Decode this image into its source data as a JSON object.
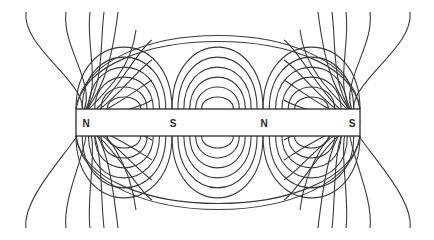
{
  "diagram": {
    "bar": {
      "x": 76,
      "y": 109,
      "width": 284,
      "height": 27
    },
    "poles": [
      {
        "label": "N",
        "x": 86,
        "y": 123
      },
      {
        "label": "S",
        "x": 173,
        "y": 123
      },
      {
        "label": "N",
        "x": 264,
        "y": 123
      },
      {
        "label": "S",
        "x": 352,
        "y": 123
      }
    ],
    "colors": {
      "line": "#3a3a3a",
      "background": "#ffffff"
    }
  }
}
